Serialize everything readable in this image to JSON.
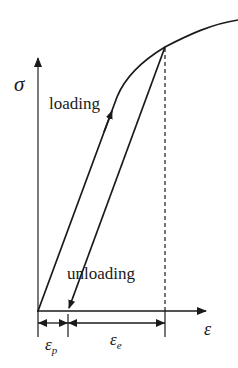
{
  "diagram": {
    "title": "",
    "axes": {
      "y_label": "σ",
      "x_label": "ε"
    },
    "curve_labels": {
      "loading": "loading",
      "unloading": "unloading"
    },
    "dimensions": {
      "plastic_strain": {
        "symbol": "ε",
        "subscript": "p"
      },
      "elastic_strain": {
        "symbol": "ε",
        "subscript": "e"
      }
    },
    "colors": {
      "line": "#1a1a1a",
      "background": "#ffffff"
    }
  }
}
